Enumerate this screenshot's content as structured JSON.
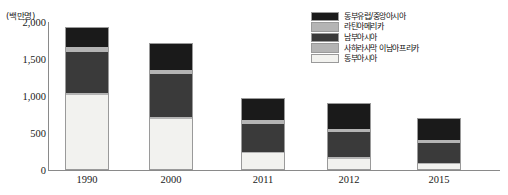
{
  "chart_data": {
    "type": "bar",
    "stacked": true,
    "title": "",
    "xlabel": "",
    "ylabel": "(백만명)",
    "unit_label": "(백만명)",
    "categories": [
      "1990",
      "2000",
      "2011",
      "2012",
      "2015"
    ],
    "ylim": [
      0,
      2000
    ],
    "yticks": [
      "0",
      "500",
      "1,000",
      "1,500",
      "2,000"
    ],
    "ytick_values": [
      0,
      500,
      1000,
      1500,
      2000
    ],
    "grid": false,
    "legend_position": "top-right",
    "series": [
      {
        "name": "동부아시아",
        "color": "#f2f2ef",
        "values": [
          1010,
          690,
          230,
          150,
          75
        ]
      },
      {
        "name": "사하라사막 이남아프리카",
        "color": "#b4b4b4",
        "values": [
          30,
          25,
          20,
          20,
          15
        ]
      },
      {
        "name": "남부아시아",
        "color": "#3a3a3a",
        "values": [
          560,
          580,
          370,
          340,
          270
        ]
      },
      {
        "name": "라틴아메리카",
        "color": "#b4b4b4",
        "values": [
          65,
          60,
          55,
          50,
          40
        ]
      },
      {
        "name": "동부유럽/중앙아시아",
        "color": "#1a1a1a",
        "values": [
          265,
          365,
          295,
          340,
          300
        ]
      }
    ],
    "totals": [
      1930,
      1720,
      970,
      900,
      700
    ],
    "legend_entries": [
      {
        "label": "동부유럽/중앙아시아",
        "color": "#1a1a1a"
      },
      {
        "label": "라틴아메리카",
        "color": "#b4b4b4"
      },
      {
        "label": "남부아시아",
        "color": "#3a3a3a"
      },
      {
        "label": "사하라사막 이남아프리카",
        "color": "#b4b4b4"
      },
      {
        "label": "동부아시아",
        "color": "#f2f2ef"
      }
    ]
  },
  "axis_colors": {
    "axis_line": "#8a8a8a",
    "text": "#1a1a1a"
  }
}
